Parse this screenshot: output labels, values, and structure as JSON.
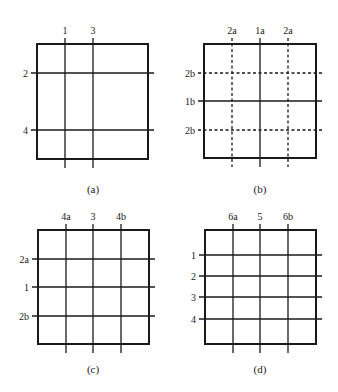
{
  "colors": {
    "line": "#1a1a1a",
    "background": "#ffffff"
  },
  "panels": [
    {
      "id": "a",
      "caption": "(a)",
      "square": {
        "x": 37,
        "y": 44,
        "w": 111,
        "h": 115
      },
      "vertical_lines": [
        {
          "label": "1",
          "x": 65,
          "style": "solid"
        },
        {
          "label": "3",
          "x": 93,
          "style": "solid"
        }
      ],
      "horizontal_lines": [
        {
          "label": "2",
          "y": 73,
          "style": "solid"
        },
        {
          "label": "4",
          "y": 130,
          "style": "solid"
        }
      ],
      "caption_pos": {
        "x": 93,
        "y": 193
      }
    },
    {
      "id": "b",
      "caption": "(b)",
      "square": {
        "x": 204,
        "y": 44,
        "w": 112,
        "h": 114
      },
      "vertical_lines": [
        {
          "label": "2a",
          "x": 232,
          "style": "dashed"
        },
        {
          "label": "1a",
          "x": 260,
          "style": "solid"
        },
        {
          "label": "2a",
          "x": 288,
          "style": "dashed"
        }
      ],
      "horizontal_lines": [
        {
          "label": "2b",
          "y": 73,
          "style": "dashed"
        },
        {
          "label": "1b",
          "y": 101,
          "style": "solid"
        },
        {
          "label": "2b",
          "y": 130,
          "style": "dashed"
        }
      ],
      "caption_pos": {
        "x": 260,
        "y": 193
      }
    },
    {
      "id": "c",
      "caption": "(c)",
      "square": {
        "x": 38,
        "y": 230,
        "w": 111,
        "h": 114
      },
      "vertical_lines": [
        {
          "label": "4a",
          "x": 66,
          "style": "solid"
        },
        {
          "label": "3",
          "x": 93,
          "style": "solid"
        },
        {
          "label": "4b",
          "x": 121,
          "style": "solid"
        }
      ],
      "horizontal_lines": [
        {
          "label": "2a",
          "y": 259,
          "style": "solid"
        },
        {
          "label": "1",
          "y": 287,
          "style": "solid"
        },
        {
          "label": "2b",
          "y": 316,
          "style": "solid"
        }
      ],
      "caption_pos": {
        "x": 93,
        "y": 373
      }
    },
    {
      "id": "d",
      "caption": "(d)",
      "square": {
        "x": 205,
        "y": 230,
        "w": 111,
        "h": 114
      },
      "vertical_lines": [
        {
          "label": "6a",
          "x": 233,
          "style": "solid"
        },
        {
          "label": "5",
          "x": 260,
          "style": "solid"
        },
        {
          "label": "6b",
          "x": 288,
          "style": "solid"
        }
      ],
      "horizontal_lines": [
        {
          "label": "1",
          "y": 255,
          "style": "solid"
        },
        {
          "label": "2",
          "y": 276,
          "style": "solid"
        },
        {
          "label": "3",
          "y": 297,
          "style": "solid"
        },
        {
          "label": "4",
          "y": 319,
          "style": "solid"
        }
      ],
      "caption_pos": {
        "x": 260,
        "y": 373
      }
    }
  ]
}
